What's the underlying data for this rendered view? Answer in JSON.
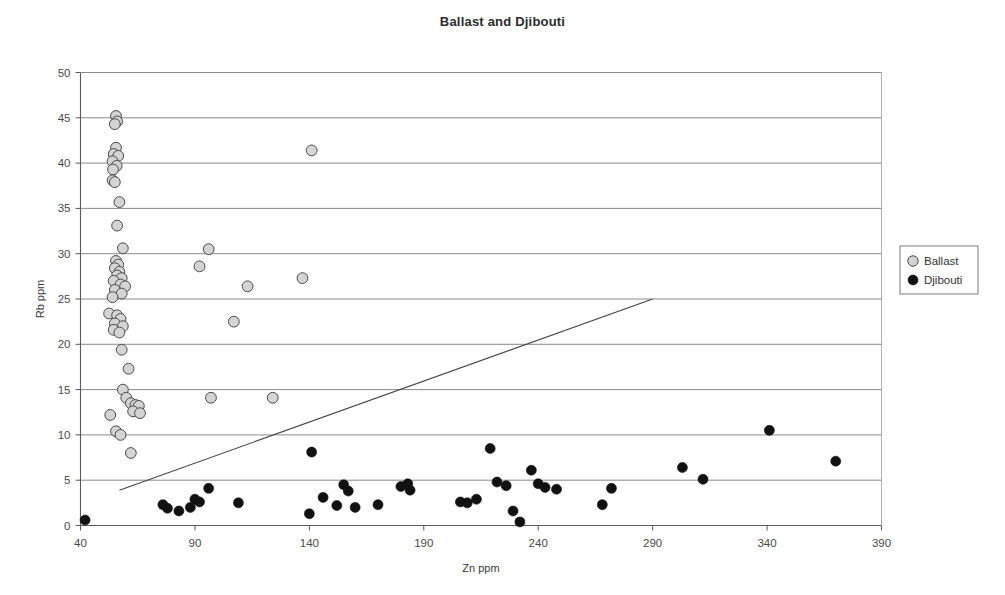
{
  "chart_data": {
    "type": "scatter",
    "title": "Ballast and Djibouti",
    "xlabel": "Zn ppm",
    "ylabel": "Rb ppm",
    "xlim": [
      40,
      390
    ],
    "ylim": [
      0,
      50
    ],
    "xticks": [
      40,
      90,
      140,
      190,
      240,
      290,
      340,
      390
    ],
    "yticks": [
      0,
      5,
      10,
      15,
      20,
      25,
      30,
      35,
      40,
      45,
      50
    ],
    "grid": "horizontal",
    "legend_position": "right",
    "series": [
      {
        "name": "Ballast",
        "marker": "circle",
        "fill": "#d4d4d4",
        "stroke": "#4a4a4a",
        "points": [
          [
            55.5,
            45.2
          ],
          [
            56.0,
            44.6
          ],
          [
            55.0,
            44.3
          ],
          [
            55.5,
            41.7
          ],
          [
            54.5,
            41.0
          ],
          [
            56.5,
            40.8
          ],
          [
            54.0,
            40.2
          ],
          [
            55.8,
            39.7
          ],
          [
            54.2,
            39.3
          ],
          [
            54.0,
            38.1
          ],
          [
            55.0,
            37.9
          ],
          [
            57.0,
            35.7
          ],
          [
            56.0,
            33.1
          ],
          [
            58.5,
            30.6
          ],
          [
            96.0,
            30.5
          ],
          [
            55.5,
            29.2
          ],
          [
            56.5,
            28.8
          ],
          [
            55.0,
            28.4
          ],
          [
            57.0,
            28.0
          ],
          [
            56.0,
            27.6
          ],
          [
            58.0,
            27.3
          ],
          [
            54.5,
            27.0
          ],
          [
            57.5,
            26.6
          ],
          [
            59.5,
            26.4
          ],
          [
            55.0,
            26.0
          ],
          [
            58.0,
            25.6
          ],
          [
            54.0,
            25.2
          ],
          [
            141.0,
            41.4
          ],
          [
            92.0,
            28.6
          ],
          [
            137.0,
            27.3
          ],
          [
            113.0,
            26.4
          ],
          [
            52.5,
            23.4
          ],
          [
            56.0,
            23.2
          ],
          [
            57.5,
            22.8
          ],
          [
            55.0,
            22.3
          ],
          [
            58.5,
            22.0
          ],
          [
            54.5,
            21.6
          ],
          [
            57.0,
            21.3
          ],
          [
            107.0,
            22.5
          ],
          [
            58.0,
            19.4
          ],
          [
            61.0,
            17.3
          ],
          [
            58.5,
            15.0
          ],
          [
            60.0,
            14.1
          ],
          [
            62.0,
            13.5
          ],
          [
            64.0,
            13.3
          ],
          [
            65.5,
            13.2
          ],
          [
            63.0,
            12.6
          ],
          [
            66.0,
            12.4
          ],
          [
            97.0,
            14.1
          ],
          [
            124.0,
            14.1
          ],
          [
            53.0,
            12.2
          ],
          [
            55.5,
            10.4
          ],
          [
            57.5,
            10.0
          ],
          [
            62.0,
            8.0
          ]
        ]
      },
      {
        "name": "Djibouti",
        "marker": "circle",
        "fill": "#111111",
        "stroke": "#111111",
        "points": [
          [
            42.0,
            0.6
          ],
          [
            76.0,
            2.3
          ],
          [
            78.0,
            1.9
          ],
          [
            83.0,
            1.6
          ],
          [
            88.0,
            2.0
          ],
          [
            90.0,
            2.9
          ],
          [
            92.0,
            2.6
          ],
          [
            96.0,
            4.1
          ],
          [
            109.0,
            2.5
          ],
          [
            141.0,
            8.1
          ],
          [
            140.0,
            1.3
          ],
          [
            146.0,
            3.1
          ],
          [
            152.0,
            2.2
          ],
          [
            155.0,
            4.5
          ],
          [
            157.0,
            3.8
          ],
          [
            160.0,
            2.0
          ],
          [
            170.0,
            2.3
          ],
          [
            180.0,
            4.3
          ],
          [
            183.0,
            4.6
          ],
          [
            184.0,
            3.9
          ],
          [
            206.0,
            2.6
          ],
          [
            209.0,
            2.5
          ],
          [
            213.0,
            2.9
          ],
          [
            219.0,
            8.5
          ],
          [
            222.0,
            4.8
          ],
          [
            226.0,
            4.4
          ],
          [
            229.0,
            1.6
          ],
          [
            232.0,
            0.4
          ],
          [
            237.0,
            6.1
          ],
          [
            240.0,
            4.6
          ],
          [
            243.0,
            4.2
          ],
          [
            248.0,
            4.0
          ],
          [
            268.0,
            2.3
          ],
          [
            272.0,
            4.1
          ],
          [
            303.0,
            6.4
          ],
          [
            312.0,
            5.1
          ],
          [
            341.0,
            10.5
          ],
          [
            370.0,
            7.1
          ]
        ]
      }
    ],
    "trendline": {
      "x1": 57,
      "y1": 3.9,
      "x2": 290,
      "y2": 25.0
    }
  }
}
